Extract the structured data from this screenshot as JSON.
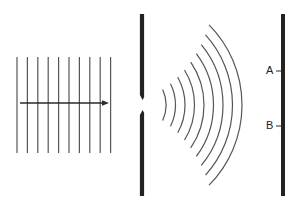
{
  "diagram": {
    "colors": {
      "background": "#ffffff",
      "ink": "#2a2a2a",
      "barrier": "#222222",
      "wave": "#555555"
    },
    "incident_waves": {
      "count": 10,
      "x_start": 17,
      "spacing": 10.4,
      "y_top": 57,
      "y_bottom": 153,
      "arrow": {
        "x1": 20,
        "x2": 109,
        "y": 103,
        "direction": "right"
      }
    },
    "barrier": {
      "x": 142,
      "y_top": 14,
      "y_bottom": 196,
      "slit": {
        "center_y": 105,
        "gap_top": 98,
        "gap_bottom": 112
      }
    },
    "diffracted_waves": {
      "count": 9,
      "center": {
        "x": 128,
        "y": 105
      },
      "radius_start": 38,
      "radius_step": 9.5
    },
    "screen": {
      "x": 283,
      "y_top": 14,
      "y_bottom": 196,
      "points": [
        {
          "label": "A",
          "y": 71
        },
        {
          "label": "B",
          "y": 126
        }
      ]
    }
  }
}
